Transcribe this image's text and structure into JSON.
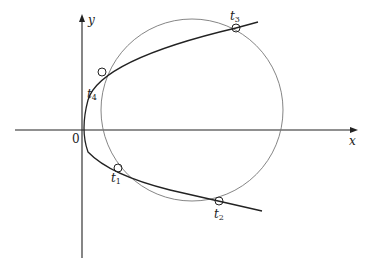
{
  "diagram": {
    "axes": {
      "x_label": "x",
      "y_label": "y",
      "origin_label": "0"
    },
    "curves": [
      {
        "name": "parabola",
        "description": "parabola opening to the right with vertex at origin",
        "color": "#222222"
      },
      {
        "name": "circle",
        "description": "circle intersecting parabola at four points",
        "color": "#666666"
      }
    ],
    "points": [
      {
        "label": "t",
        "sub": "1",
        "x": 118,
        "y": 168
      },
      {
        "label": "t",
        "sub": "2",
        "x": 219,
        "y": 201
      },
      {
        "label": "t",
        "sub": "3",
        "x": 236,
        "y": 28
      },
      {
        "label": "t",
        "sub": "4",
        "x": 102,
        "y": 72
      }
    ]
  }
}
